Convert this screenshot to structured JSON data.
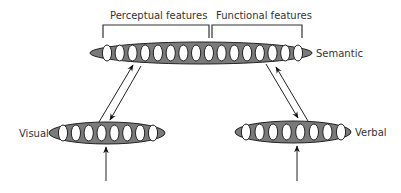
{
  "diagram": {
    "labels": {
      "perceptual": "Perceptual features",
      "functional": "Functional features",
      "semantic": "Semantic",
      "visual": "Visual",
      "verbal": "Verbal"
    },
    "layers": [
      {
        "name": "Semantic",
        "units": 16
      },
      {
        "name": "Visual",
        "units": 8
      },
      {
        "name": "Verbal",
        "units": 8
      }
    ],
    "connections": [
      {
        "from": "Visual",
        "to": "Semantic",
        "type": "bidirectional"
      },
      {
        "from": "Verbal",
        "to": "Semantic",
        "type": "bidirectional"
      },
      {
        "input_to": "Visual"
      },
      {
        "input_to": "Verbal"
      }
    ],
    "colors": {
      "layer_fill": "#7a7a7a",
      "unit_fill": "#ffffff",
      "stroke": "#222222"
    }
  }
}
